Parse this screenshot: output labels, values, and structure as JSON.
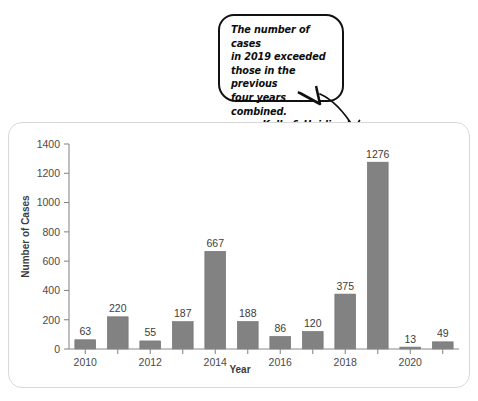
{
  "annotation": {
    "text": "The number of cases\nin 2019 exceeded\nthose in the previous\nfour years combined.",
    "signature": "- Kelly & Heidi",
    "arrow_icon": "curved-arrow-icon",
    "points_to": "1276"
  },
  "chart_data": {
    "type": "bar",
    "title": "",
    "xlabel": "Year",
    "ylabel": "Number of Cases",
    "categories": [
      "2010",
      "2011",
      "2012",
      "2013",
      "2014",
      "2015",
      "2016",
      "2017",
      "2018",
      "2019",
      "2020",
      "2021"
    ],
    "values": [
      63,
      220,
      55,
      187,
      667,
      188,
      86,
      120,
      375,
      1276,
      13,
      49
    ],
    "data_labels": [
      "63",
      "220",
      "55",
      "187",
      "667",
      "188",
      "86",
      "120",
      "375",
      "1276",
      "13",
      "49"
    ],
    "x_tick_labels": [
      "2010",
      "",
      "2012",
      "",
      "2014",
      "",
      "2016",
      "",
      "2018",
      "",
      "2020",
      ""
    ],
    "ylim": [
      0,
      1400
    ],
    "y_ticks": [
      0,
      200,
      400,
      600,
      800,
      1000,
      1200,
      1400
    ],
    "y_tick_labels": [
      "0",
      "200",
      "400",
      "600",
      "800",
      "1000",
      "1200",
      "1400"
    ],
    "grid": false,
    "legend": null,
    "bar_color": "#828282",
    "axis_color": "#8a8a8a",
    "text_color": "#3c3c3c",
    "panel_border_color": "#d8d8d8",
    "background": "#ffffff"
  }
}
